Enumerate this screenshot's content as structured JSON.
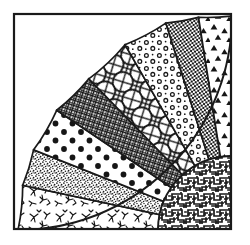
{
  "figure": {
    "background_color": "#ffffff",
    "ink_color": "#1a1a1a",
    "frame": {
      "name": "square-border",
      "x": 13,
      "y": 13,
      "width": 219,
      "height": 217,
      "stroke_width": 2,
      "stroke_color": "#1a1a1a",
      "fill_color": "#ffffff"
    },
    "fan": {
      "center_x": 232,
      "center_y": 230,
      "outer_radius": 214,
      "inner_radius": 74,
      "start_angle_deg": 180,
      "end_angle_deg": 270,
      "wedge_count": 8,
      "stroke_color": "#1a1a1a",
      "stroke_width": 1.6
    },
    "wedges": [
      {
        "index": 0,
        "name": "wedge-scribble-sprigs",
        "pattern": "scribble-sprigs",
        "pattern_label": "Scattered scribbled sprigs / branch marks",
        "angle_start_deg": 180,
        "angle_end_deg": 192,
        "fill_tone": "light",
        "density": "medium"
      },
      {
        "index": 1,
        "name": "wedge-fine-stipple",
        "pattern": "fine-stipple",
        "pattern_label": "Fine grey stipple / sand grain",
        "angle_start_deg": 192,
        "angle_end_deg": 202,
        "fill_tone": "mid-grey",
        "density": "high"
      },
      {
        "index": 2,
        "name": "wedge-large-polka-dots",
        "pattern": "large-polka-dots",
        "pattern_label": "Large round polka dots on white",
        "angle_start_deg": 202,
        "angle_end_deg": 215,
        "fill_tone": "light",
        "density": "low"
      },
      {
        "index": 3,
        "name": "wedge-fine-crosshatch",
        "pattern": "fine-crosshatch",
        "pattern_label": "Fine dark crosshatch grid",
        "angle_start_deg": 215,
        "angle_end_deg": 228,
        "fill_tone": "dark",
        "density": "high"
      },
      {
        "index": 4,
        "name": "wedge-diamond-lattice",
        "pattern": "diamond-lattice",
        "pattern_label": "Diagonal diamond lattice with curved interlace",
        "angle_start_deg": 228,
        "angle_end_deg": 240,
        "fill_tone": "light",
        "density": "medium"
      },
      {
        "index": 5,
        "name": "wedge-small-rings",
        "pattern": "small-rings",
        "pattern_label": "Small open rings / flower dots on white",
        "angle_start_deg": 240,
        "angle_end_deg": 252,
        "fill_tone": "light",
        "density": "medium"
      },
      {
        "index": 6,
        "name": "wedge-dark-checker",
        "pattern": "dark-checker",
        "pattern_label": "Dense dark checkerboard speckle",
        "angle_start_deg": 252,
        "angle_end_deg": 261,
        "fill_tone": "dark",
        "density": "very-high"
      },
      {
        "index": 7,
        "name": "wedge-triangle-confetti",
        "pattern": "triangle-confetti",
        "pattern_label": "Scattered solid triangles / heart shapes",
        "angle_start_deg": 261,
        "angle_end_deg": 270,
        "fill_tone": "light",
        "density": "low"
      }
    ],
    "inner_sector": {
      "name": "inner-maze-sector",
      "pattern": "maze-labyrinth",
      "pattern_label": "Dense maze / labyrinth weave",
      "fill_tone": "mid-dark",
      "density": "very-high",
      "radius": 74
    }
  }
}
